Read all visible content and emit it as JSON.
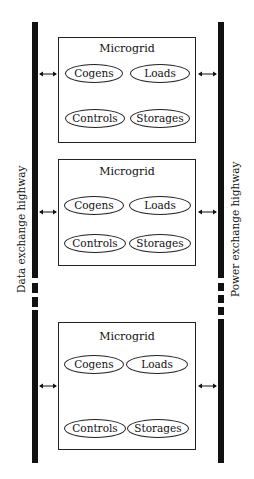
{
  "diagram": {
    "left_highway": {
      "label": "Data exchange highway"
    },
    "right_highway": {
      "label": "Power exchange highway"
    },
    "microgrids": [
      {
        "title": "Microgrid",
        "components": [
          "Cogens",
          "Loads",
          "Controls",
          "Storages"
        ]
      },
      {
        "title": "Microgrid",
        "components": [
          "Cogens",
          "Loads",
          "Controls",
          "Storages"
        ]
      },
      {
        "title": "Microgrid",
        "components": [
          "Cogens",
          "Loads",
          "Controls",
          "Storages"
        ]
      }
    ],
    "connector": "bidirectional-arrow",
    "colors": {
      "line": "#111111",
      "background": "#ffffff"
    }
  }
}
